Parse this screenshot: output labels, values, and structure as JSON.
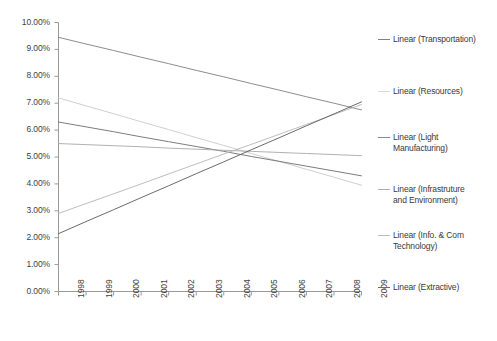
{
  "chart_data": {
    "type": "line",
    "title": "",
    "subtitle": "",
    "xlabel": "",
    "ylabel": "",
    "x": [
      1998,
      1999,
      2000,
      2001,
      2002,
      2003,
      2004,
      2005,
      2006,
      2007,
      2008,
      2009
    ],
    "xtick_labels": [
      "1998",
      "1999",
      "2000",
      "2001",
      "2002",
      "2003",
      "2004",
      "2005",
      "2006",
      "2007",
      "2008",
      "2009"
    ],
    "ytick_labels": [
      "0.00%",
      "1.00%",
      "2.00%",
      "3.00%",
      "4.00%",
      "5.00%",
      "6.00%",
      "7.00%",
      "8.00%",
      "9.00%",
      "10.00%"
    ],
    "ytick_values": [
      0,
      1,
      2,
      3,
      4,
      5,
      6,
      7,
      8,
      9,
      10
    ],
    "ylim": [
      0,
      10
    ],
    "xlim": [
      1998,
      2009
    ],
    "grid": false,
    "legend_position": "right",
    "value_unit": "percent",
    "series": [
      {
        "name": "Linear (Transportation)",
        "color": "#808080",
        "start_value": 9.45,
        "end_value": 6.75,
        "values": [
          9.45,
          9.2,
          8.96,
          8.71,
          8.47,
          8.22,
          7.98,
          7.73,
          7.49,
          7.24,
          7.0,
          6.75
        ]
      },
      {
        "name": "Linear (Resources)",
        "color": "#c9c9c9",
        "start_value": 7.2,
        "end_value": 3.95,
        "values": [
          7.2,
          6.9,
          6.61,
          6.31,
          6.02,
          5.72,
          5.43,
          5.13,
          4.84,
          4.54,
          4.25,
          3.95
        ]
      },
      {
        "name": "Linear (Light Manufacturing)",
        "color": "#6e6e6e",
        "start_value": 6.3,
        "end_value": 4.3,
        "values": [
          6.3,
          6.12,
          5.94,
          5.75,
          5.57,
          5.39,
          5.21,
          5.02,
          4.84,
          4.66,
          4.48,
          4.3
        ]
      },
      {
        "name": "Linear (Infrastruture and Environment)",
        "color": "#a8a8a8",
        "start_value": 5.5,
        "end_value": 5.05,
        "values": [
          5.5,
          5.46,
          5.42,
          5.38,
          5.33,
          5.29,
          5.25,
          5.21,
          5.17,
          5.13,
          5.09,
          5.05
        ]
      },
      {
        "name": "Linear (Info. & Com Technology)",
        "color": "#b5b5b5",
        "start_value": 2.9,
        "end_value": 6.95,
        "values": [
          2.9,
          3.27,
          3.63,
          4.0,
          4.37,
          4.74,
          5.11,
          5.47,
          5.84,
          6.21,
          6.58,
          6.95
        ]
      },
      {
        "name": "Linear (Extractive)",
        "color": "#5a5a5a",
        "start_value": 2.15,
        "end_value": 7.05,
        "values": [
          2.15,
          2.6,
          3.04,
          3.49,
          3.93,
          4.38,
          4.82,
          5.27,
          5.71,
          6.16,
          6.6,
          7.05
        ]
      }
    ]
  },
  "legend": {
    "entries": [
      {
        "label": "Linear (Transportation)",
        "color": "#808080",
        "top": 34
      },
      {
        "label": "Linear (Resources)",
        "color": "#dcdcdc",
        "top": 86
      },
      {
        "label": "Linear (Light\nManufacturing)",
        "color": "#8a8a8a",
        "top": 132
      },
      {
        "label": "Linear (Infrastruture\nand Environment)",
        "color": "#b0b0b0",
        "top": 184
      },
      {
        "label": "Linear (Info. & Com\nTechnology)",
        "color": "#bcbcbc",
        "top": 230
      },
      {
        "label": "Linear (Extractive)",
        "color": "#6e6e6e",
        "top": 282
      }
    ]
  },
  "axes": {
    "axis_color": "#9a9a9a",
    "tick_color": "#9a9a9a"
  }
}
